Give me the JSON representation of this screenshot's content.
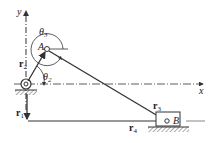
{
  "diagram": {
    "type": "slider-crank mechanism vector loop",
    "axes": {
      "x_label": "x",
      "y_label": "y"
    },
    "points": {
      "A": "A",
      "B": "B"
    },
    "vectors": [
      {
        "name": "r",
        "sub": "1"
      },
      {
        "name": "r",
        "sub": "2"
      },
      {
        "name": "r",
        "sub": "3"
      },
      {
        "name": "r",
        "sub": "4"
      }
    ],
    "angles": [
      {
        "name": "θ",
        "sub": "2"
      },
      {
        "name": "θ",
        "sub": "3"
      }
    ],
    "colors": {
      "line": "#333333",
      "hatch": "#555555",
      "background": "#ffffff"
    }
  }
}
